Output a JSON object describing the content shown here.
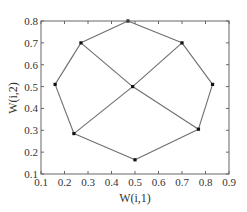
{
  "chart_data": {
    "type": "scatter",
    "title": "",
    "xlabel": "W(i,1)",
    "ylabel": "W(i,2)",
    "xlim": [
      0.1,
      0.9
    ],
    "ylim": [
      0.1,
      0.8
    ],
    "xticks": [
      "0.1",
      "0.2",
      "0.3",
      "0.4",
      "0.5",
      "0.6",
      "0.7",
      "0.8",
      "0.9"
    ],
    "yticks": [
      "0.1",
      "0.2",
      "0.3",
      "0.4",
      "0.5",
      "0.6",
      "0.7",
      "0.8"
    ],
    "grid": false,
    "legend": null,
    "points": [
      {
        "id": "top",
        "x": 0.47,
        "y": 0.8
      },
      {
        "id": "upper-left",
        "x": 0.27,
        "y": 0.7
      },
      {
        "id": "upper-right",
        "x": 0.7,
        "y": 0.7
      },
      {
        "id": "left",
        "x": 0.16,
        "y": 0.51
      },
      {
        "id": "center",
        "x": 0.49,
        "y": 0.5
      },
      {
        "id": "right",
        "x": 0.83,
        "y": 0.51
      },
      {
        "id": "lower-left",
        "x": 0.24,
        "y": 0.285
      },
      {
        "id": "lower-right",
        "x": 0.77,
        "y": 0.305
      },
      {
        "id": "bottom",
        "x": 0.5,
        "y": 0.165
      }
    ],
    "edges": [
      [
        "top",
        "upper-right"
      ],
      [
        "upper-right",
        "right"
      ],
      [
        "right",
        "lower-right"
      ],
      [
        "lower-right",
        "bottom"
      ],
      [
        "bottom",
        "lower-left"
      ],
      [
        "lower-left",
        "left"
      ],
      [
        "left",
        "upper-left"
      ],
      [
        "upper-left",
        "top"
      ],
      [
        "upper-left",
        "center"
      ],
      [
        "center",
        "lower-right"
      ],
      [
        "upper-right",
        "center"
      ],
      [
        "center",
        "lower-left"
      ]
    ],
    "colors": {
      "line": "#6e6e6e",
      "marker": "#111111",
      "axis": "#666666",
      "text": "#333333"
    }
  }
}
